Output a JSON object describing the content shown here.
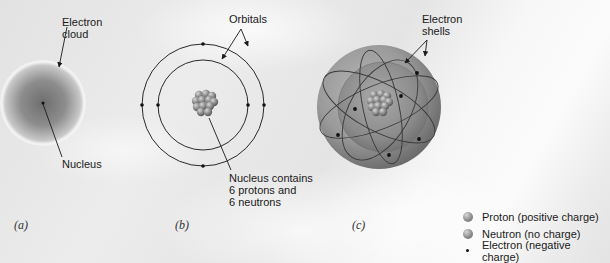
{
  "panels": {
    "a": {
      "label": "(a)",
      "annotations": {
        "cloud": "Electron\ncloud",
        "nucleus": "Nucleus"
      }
    },
    "b": {
      "label": "(b)",
      "annotations": {
        "orbitals": "Orbitals",
        "nucleus": "Nucleus contains\n6 protons and\n6 neutrons"
      },
      "electrons_inner_orbital": 2,
      "electrons_outer_orbital": 4
    },
    "c": {
      "label": "(c)",
      "annotations": {
        "shells": "Electron\nshells"
      },
      "electron_count": 6
    }
  },
  "legend": {
    "items": [
      {
        "icon": "proton-ball-icon",
        "label": "Proton (positive charge)"
      },
      {
        "icon": "neutron-ball-icon",
        "label": "Neutron (no charge)"
      },
      {
        "icon": "electron-dot-icon",
        "label": "Electron (negative charge)"
      }
    ]
  },
  "colors": {
    "background": "#e6e6e6",
    "line": "#2a2a2a",
    "sphere_outer": "#8f8f8f",
    "sphere_inner": "#7a7a7a",
    "nucleon": "#8a8a8a",
    "electron": "#111111"
  }
}
